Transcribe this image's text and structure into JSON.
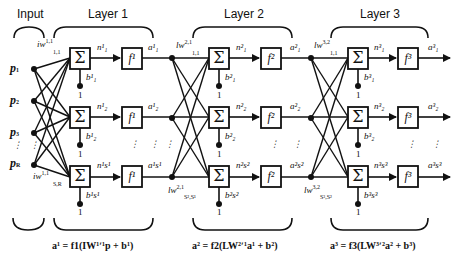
{
  "headers": {
    "input": "Input",
    "layer1": "Layer 1",
    "layer2": "Layer 2",
    "layer3": "Layer 3"
  },
  "inputs": [
    "p",
    "p",
    "p",
    "p"
  ],
  "input_subs": [
    "1",
    "2",
    "3",
    "R"
  ],
  "weights": {
    "iw_top": "iw",
    "iw_top_sup": "1,1",
    "iw_top_sub": "1,1",
    "iw_bot": "iw",
    "iw_bot_sup": "1,1",
    "iw_bot_sub": "S,R",
    "lw2_top": "lw",
    "lw2_top_sup": "2,1",
    "lw2_top_sub": "1,1",
    "lw2_bot": "lw",
    "lw2_bot_sup": "2,1",
    "lw2_bot_sub": "S²,S¹",
    "lw3_top": "lw",
    "lw3_top_sup": "3,2",
    "lw3_top_sub": "1,1",
    "lw3_bot": "lw",
    "lw3_bot_sup": "3,2",
    "lw3_bot_sub": "S³,S²"
  },
  "layers": [
    {
      "sum_symbol": "Σ",
      "transfer": "f¹",
      "net": [
        "n¹₁",
        "n¹₂",
        "n¹s¹"
      ],
      "out": [
        "a¹₁",
        "a¹₂",
        "a¹s¹"
      ],
      "bias": [
        "b¹₁",
        "b¹₂",
        "b¹s¹"
      ]
    },
    {
      "sum_symbol": "Σ",
      "transfer": "f²",
      "net": [
        "n²₁",
        "n²₂",
        "n²s²"
      ],
      "out": [
        "a²₁",
        "a²₂",
        "a²s²"
      ],
      "bias": [
        "b²₁",
        "b²₂",
        "b²s²"
      ]
    },
    {
      "sum_symbol": "Σ",
      "transfer": "f³",
      "net": [
        "n³₁",
        "n³₂",
        "n³s³"
      ],
      "out": [
        "a³₁",
        "a³₂",
        "a³s³"
      ],
      "bias": [
        "b³₁",
        "b³₂",
        "b³s³"
      ]
    }
  ],
  "bias_input": "1",
  "ellipsis": "⋮",
  "equations": {
    "layer1": "a¹ = f1(IW¹ʹ¹p + b¹)",
    "layer2": "a² = f2(LW²ʹ¹a¹ + b²)",
    "layer3": "a³ = f3(LW³ʹ²a² + b³)"
  },
  "colors": {
    "stroke": "#111111",
    "background": "#ffffff"
  }
}
